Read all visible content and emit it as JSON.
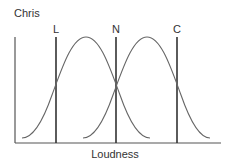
{
  "diagram": {
    "title": "Chris",
    "xlabel": "Loudness",
    "markers": [
      {
        "label": "L",
        "x": 56
      },
      {
        "label": "N",
        "x": 116
      },
      {
        "label": "C",
        "x": 177
      }
    ],
    "curves": [
      {
        "name": "left-distribution",
        "start_x": 22,
        "peak_x": 86,
        "end_x": 150
      },
      {
        "name": "right-distribution",
        "start_x": 83,
        "peak_x": 147,
        "end_x": 210
      }
    ],
    "colors": {
      "line": "#555555",
      "curve": "#666666",
      "text": "#333333"
    }
  }
}
